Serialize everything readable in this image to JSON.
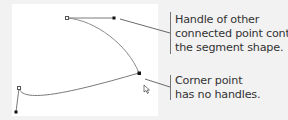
{
  "diagram": {
    "background": "#f2f2f2",
    "canvas_color": "#ffffff",
    "path_color": "#888888",
    "handle_line_color": "#999999",
    "point_color": "#111111",
    "leader_color": "#444444",
    "text_color": "#333333",
    "callouts": [
      {
        "id": "handle-callout",
        "lines": [
          "Handle of other",
          "connected point controls",
          "the segment shape."
        ]
      },
      {
        "id": "corner-callout",
        "lines": [
          "Corner point",
          "has no handles."
        ]
      }
    ],
    "icons": {
      "cursor": "direct-selection-arrow-icon"
    }
  }
}
